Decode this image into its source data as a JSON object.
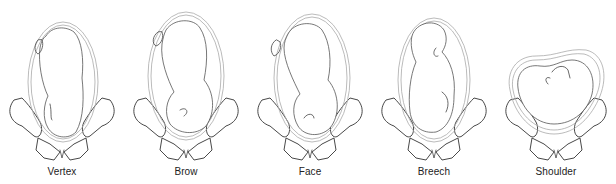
{
  "figure": {
    "panels": [
      {
        "id": "vertex",
        "label": "Vertex"
      },
      {
        "id": "brow",
        "label": "Brow"
      },
      {
        "id": "face",
        "label": "Face"
      },
      {
        "id": "breech",
        "label": "Breech"
      },
      {
        "id": "shoulder",
        "label": "Shoulder"
      }
    ]
  }
}
